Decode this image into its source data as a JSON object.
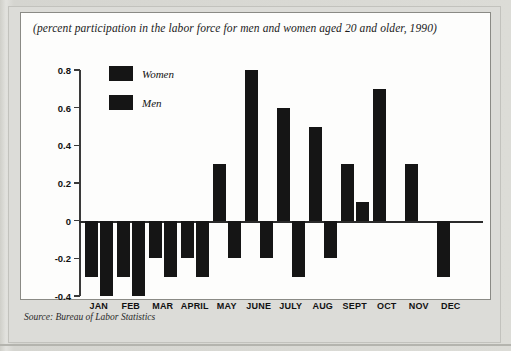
{
  "figure": {
    "title": "(percent participation in the labor force for men and women aged 20 and older, 1990)",
    "source": "Source: Bureau of Labor Statistics"
  },
  "legend": {
    "items": [
      {
        "label": "Women",
        "color": "#151515"
      },
      {
        "label": "Men",
        "color": "#151515"
      }
    ]
  },
  "chart_data": {
    "type": "bar",
    "title": "(percent participation in the labor force for men and women aged 20 and older, 1990)",
    "xlabel": "",
    "ylabel": "",
    "ylim": [
      -0.4,
      0.8
    ],
    "yticks": [
      0.8,
      0.6,
      0.4,
      0.2,
      0,
      -0.2,
      -0.4
    ],
    "ytick_labels": [
      "0.8",
      "0.6",
      "0.4",
      "0.2",
      "0",
      "-0.2",
      "-0.4"
    ],
    "grid": false,
    "legend_position": "top-left",
    "categories": [
      "JAN",
      "FEB",
      "MAR",
      "APRIL",
      "MAY",
      "JUNE",
      "JULY",
      "AUG",
      "SEPT",
      "OCT",
      "NOV",
      "DEC"
    ],
    "series": [
      {
        "name": "Women",
        "color": "#151515",
        "values": [
          -0.3,
          -0.3,
          -0.2,
          -0.2,
          0.3,
          0.8,
          0.6,
          0.5,
          0.3,
          0.7,
          0.3,
          -0.3
        ]
      },
      {
        "name": "Men",
        "color": "#151515",
        "values": [
          -0.4,
          -0.4,
          -0.3,
          -0.3,
          -0.2,
          -0.2,
          -0.3,
          -0.2,
          0.1,
          0.0,
          0.0,
          0.0
        ]
      }
    ]
  }
}
